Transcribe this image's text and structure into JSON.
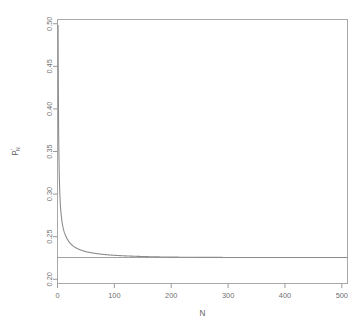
{
  "chart_data": {
    "type": "line",
    "title": "",
    "xlabel": "N",
    "ylabel": "P'N",
    "ylabel_parts": {
      "base": "P",
      "prime": "'",
      "sub": "N"
    },
    "xlim": [
      0,
      510
    ],
    "ylim": [
      0.195,
      0.505
    ],
    "xticks": [
      0,
      100,
      200,
      300,
      400,
      500
    ],
    "xticklabels": [
      "0",
      "100",
      "200",
      "300",
      "400",
      "500"
    ],
    "yticks": [
      0.2,
      0.25,
      0.3,
      0.35,
      0.4,
      0.45,
      0.5
    ],
    "yticklabels": [
      "0.20",
      "0.25",
      "0.30",
      "0.35",
      "0.40",
      "0.45",
      "0.50"
    ],
    "grid": false,
    "legend": null,
    "series": [
      {
        "name": "P'_N",
        "note": "monotone decreasing curve starting near 0.50 at N=1, decaying to the asymptote",
        "x": [
          1,
          2,
          3,
          4,
          5,
          6,
          8,
          10,
          12,
          15,
          20,
          25,
          30,
          40,
          50,
          60,
          70,
          80,
          90,
          100,
          120,
          140,
          160,
          180,
          200,
          250,
          300,
          350,
          400,
          450,
          500
        ],
        "y": [
          0.4985,
          0.372,
          0.326,
          0.302,
          0.288,
          0.279,
          0.2672,
          0.26,
          0.2552,
          0.25,
          0.2442,
          0.2404,
          0.2378,
          0.2345,
          0.2324,
          0.231,
          0.23,
          0.2292,
          0.2286,
          0.2281,
          0.2274,
          0.2269,
          0.2265,
          0.2262,
          0.226,
          0.2257,
          0.2256,
          0.2256,
          0.2256,
          0.2255,
          0.2255
        ]
      }
    ],
    "reference_line": {
      "orientation": "horizontal",
      "value": 0.2255,
      "label": ""
    }
  },
  "axis": {
    "x_title": "N",
    "y_title": "P'N"
  }
}
